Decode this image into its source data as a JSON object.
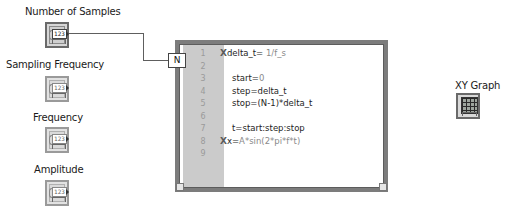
{
  "controls": [
    {
      "label": "Number of Samples",
      "value_glyph": "123",
      "wired": true
    },
    {
      "label": "Sampling Frequency",
      "value_glyph": "123",
      "wired": false
    },
    {
      "label": "Frequency",
      "value_glyph": "123",
      "wired": false
    },
    {
      "label": "Amplitude",
      "value_glyph": "123",
      "wired": false
    }
  ],
  "mathscript_node": {
    "input_terminal": "N",
    "lines": [
      {
        "n": "1",
        "text": "delta_t= ",
        "literal": "1/f_s",
        "error_marker": true
      },
      {
        "n": "2",
        "text": "",
        "literal": "",
        "error_marker": false
      },
      {
        "n": "3",
        "text": "start=",
        "literal": "0",
        "error_marker": false
      },
      {
        "n": "4",
        "text": "step=delta_t",
        "literal": "",
        "error_marker": false
      },
      {
        "n": "5",
        "text": "stop=(N-1)*delta_t",
        "literal": "",
        "error_marker": false
      },
      {
        "n": "6",
        "text": "",
        "literal": "",
        "error_marker": false
      },
      {
        "n": "7",
        "text": "t=start:step:stop",
        "literal": "",
        "error_marker": false
      },
      {
        "n": "8",
        "text": "x=",
        "literal": "A*sin(2*pi*f*t)",
        "error_marker": true
      },
      {
        "n": "9",
        "text": "",
        "literal": "",
        "error_marker": false
      }
    ],
    "error_marker_glyph": "X"
  },
  "indicator": {
    "label": "XY Graph"
  },
  "colors": {
    "wire": "#5e5e5e",
    "node_border": "#7c7c7c",
    "gutter": "#cbcbcb"
  }
}
